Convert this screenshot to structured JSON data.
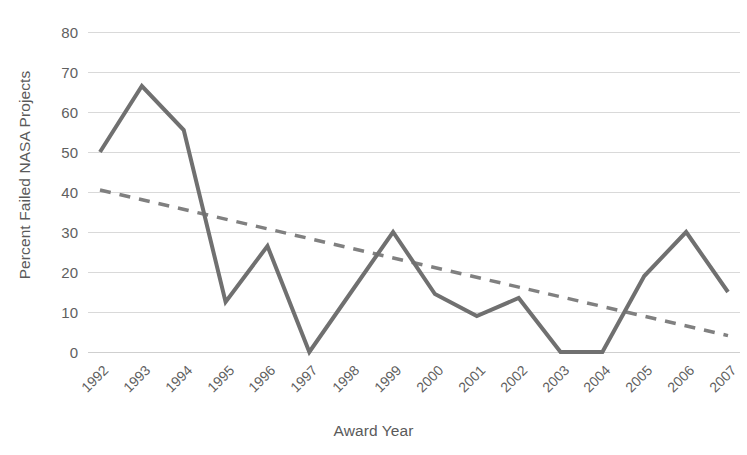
{
  "chart_data": {
    "type": "line",
    "title": "",
    "xlabel": "Award Year",
    "ylabel": "Percent Failed NASA Projects",
    "categories": [
      "1992",
      "1993",
      "1994",
      "1995",
      "1996",
      "1997",
      "1998",
      "1999",
      "2000",
      "2001",
      "2002",
      "2003",
      "2004",
      "2005",
      "2006",
      "2007"
    ],
    "series": [
      {
        "name": "Percent Failed NASA Projects",
        "style": "solid",
        "color": "#707070",
        "values": [
          50,
          66.5,
          55.5,
          12.5,
          26.5,
          0,
          15,
          30,
          14.5,
          9,
          13.5,
          0,
          0,
          19,
          30,
          15
        ]
      },
      {
        "name": "Linear trendline",
        "style": "dashed",
        "color": "#808080",
        "values": [
          40.5,
          38.1,
          35.6,
          33.2,
          30.8,
          28.4,
          25.9,
          23.5,
          21.1,
          18.7,
          16.2,
          13.8,
          11.4,
          9.0,
          6.5,
          4.1
        ]
      }
    ],
    "ylim": [
      0,
      80
    ],
    "yticks": [
      0,
      10,
      20,
      30,
      40,
      50,
      60,
      70,
      80
    ],
    "ytick_labels": [
      "0",
      "10",
      "20",
      "30",
      "40",
      "50",
      "60",
      "70",
      "80"
    ],
    "grid": true,
    "legend": "none",
    "background": "#ffffff",
    "gridline_color": "#d9d9d9",
    "text_color": "#5f5f5f"
  }
}
